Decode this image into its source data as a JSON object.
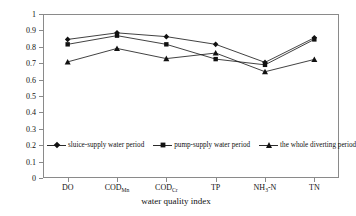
{
  "chart_data": {
    "type": "line",
    "title": "",
    "xlabel": "water quality index",
    "ylabel": "correlation degree",
    "categories": [
      "DO",
      "CODMn",
      "CODCr",
      "TP",
      "NH3-N",
      "TN"
    ],
    "category_labels": [
      {
        "base": "DO",
        "sub": ""
      },
      {
        "base": "COD",
        "sub": "Mn"
      },
      {
        "base": "COD",
        "sub": "Cr"
      },
      {
        "base": "TP",
        "sub": ""
      },
      {
        "base": "NH",
        "sub": "3",
        "tail": "-N"
      },
      {
        "base": "TN",
        "sub": ""
      }
    ],
    "ylim": [
      0,
      1
    ],
    "yticks": [
      0,
      0.1,
      0.2,
      0.3,
      0.4,
      0.5,
      0.6,
      0.7,
      0.8,
      0.9,
      1
    ],
    "ytick_labels": [
      "0",
      "0.1",
      "0.2",
      "0.3",
      "0.4",
      "0.5",
      "0.6",
      "0.7",
      "0.8",
      "0.9",
      "1"
    ],
    "grid": false,
    "legend_position": "inside-lower-left",
    "series": [
      {
        "name": "sluice-supply water period",
        "marker": "diamond",
        "color": "#111111",
        "values": [
          0.845,
          0.885,
          0.862,
          0.815,
          0.705,
          0.855
        ]
      },
      {
        "name": "pump-supply water period",
        "marker": "square",
        "color": "#111111",
        "values": [
          0.815,
          0.868,
          0.815,
          0.725,
          0.69,
          0.845
        ]
      },
      {
        "name": "the whole diverting period",
        "marker": "triangle",
        "color": "#111111",
        "values": [
          0.708,
          0.79,
          0.728,
          0.762,
          0.648,
          0.723
        ]
      }
    ]
  },
  "legend": {
    "items": [
      "sluice-supply water period",
      "pump-supply water period",
      "the whole diverting period"
    ]
  },
  "axes": {
    "x_title": "water quality index",
    "y_title": "correlation degree"
  }
}
